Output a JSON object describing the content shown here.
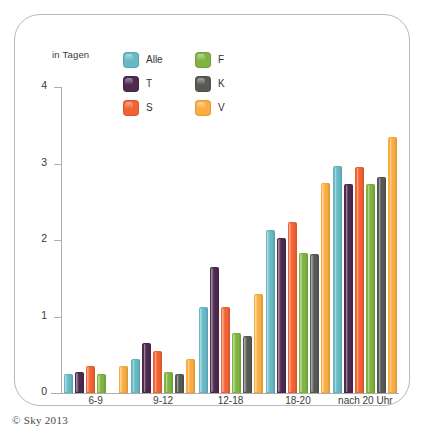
{
  "credit": "© Sky 2013",
  "axis_caption": "in Tagen",
  "legend": {
    "items": [
      {
        "label": "Alle",
        "color": "#67b9c6",
        "icon": "color-swatch-icon"
      },
      {
        "label": "F",
        "color": "#7fb441",
        "icon": "color-swatch-icon"
      },
      {
        "label": "T",
        "color": "#4d2a4e",
        "icon": "color-swatch-icon"
      },
      {
        "label": "K",
        "color": "#575a54",
        "icon": "color-swatch-icon"
      },
      {
        "label": "S",
        "color": "#f26232",
        "icon": "color-swatch-icon"
      },
      {
        "label": "V",
        "color": "#f9ad41",
        "icon": "color-swatch-icon"
      }
    ]
  },
  "chart_data": {
    "type": "bar",
    "title": "",
    "subtitle": "",
    "xlabel": "",
    "ylabel": "in Tagen",
    "ylim": [
      0,
      4
    ],
    "yticks": [
      0,
      1,
      2,
      3,
      4
    ],
    "ytick_labels": [
      "0",
      "1",
      "2",
      "3",
      "4"
    ],
    "grid": false,
    "legend_position": "top-center",
    "categories": [
      "6-9",
      "9-12",
      "12-18",
      "18-20",
      "nach 20 Uhr"
    ],
    "series": [
      {
        "name": "Alle",
        "color": "#67b9c6",
        "values": [
          0.25,
          0.45,
          1.13,
          2.13,
          2.97
        ]
      },
      {
        "name": "T",
        "color": "#4d2a4e",
        "values": [
          0.28,
          0.65,
          1.65,
          2.03,
          2.73
        ]
      },
      {
        "name": "S",
        "color": "#f26232",
        "values": [
          0.35,
          0.55,
          1.12,
          2.23,
          2.95
        ]
      },
      {
        "name": "F",
        "color": "#7fb441",
        "values": [
          0.25,
          0.28,
          0.78,
          1.83,
          2.73
        ]
      },
      {
        "name": "K",
        "color": "#575a54",
        "values": [
          0.0,
          0.25,
          0.75,
          1.82,
          2.82
        ]
      },
      {
        "name": "V",
        "color": "#f9ad41",
        "values": [
          0.35,
          0.45,
          1.3,
          2.75,
          3.35
        ]
      }
    ]
  }
}
